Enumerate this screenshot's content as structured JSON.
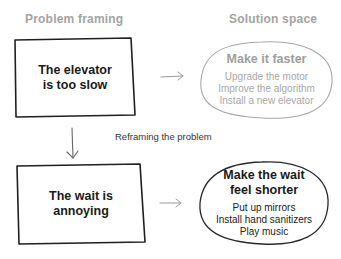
{
  "headers": {
    "problem": "Problem framing",
    "solution": "Solution space"
  },
  "rows": [
    {
      "problem": {
        "line1": "The elevator",
        "line2": "is too slow"
      },
      "solution": {
        "title": "Make it faster",
        "items": [
          "Upgrade the motor",
          "Improve the algorithm",
          "Install a new elevator"
        ],
        "style": "faded"
      }
    },
    {
      "problem": {
        "line1": "The wait is",
        "line2": "annoying"
      },
      "solution": {
        "title_line1": "Make the wait",
        "title_line2": "feel shorter",
        "items": [
          "Put up mirrors",
          "Install hand sanitizers",
          "Play music"
        ],
        "style": "active"
      }
    }
  ],
  "transition_label": "Reframing the problem",
  "colors": {
    "ink": "#1a1a1a",
    "faded": "#a3a3a3",
    "arrow": "#8a8a8a"
  }
}
